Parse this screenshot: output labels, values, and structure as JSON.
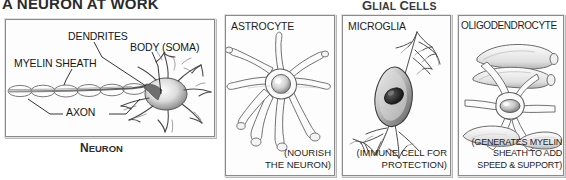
{
  "headings": {
    "neuron_title": "A NEURON AT WORK",
    "glial_title_first": "G",
    "glial_title_first_rest": "LIAL ",
    "glial_title_second": "C",
    "glial_title_second_rest": "ELLS"
  },
  "neuron_panel": {
    "caption_first": "N",
    "caption_rest": "EURON",
    "callouts": {
      "dendrites": "DENDRITES",
      "body": "BODY (SOMA)",
      "myelin_sheath": "MYELIN SHEATH",
      "axon": "AXON"
    }
  },
  "glial_panels": [
    {
      "key": "astrocyte",
      "label": "ASTROCYTE",
      "caption_lines": [
        "(NOURISH",
        "THE NEURON)"
      ]
    },
    {
      "key": "microglia",
      "label": "MICROGLIA",
      "caption_lines": [
        "(IMMUNE CELL FOR",
        "PROTECTION)"
      ]
    },
    {
      "key": "oligodendrocyte",
      "label": "OLIGODENDROCYTE",
      "caption_lines": [
        "(GENERATES MYELIN",
        "SHEATH TO ADD",
        "SPEED & SUPPORT)"
      ]
    }
  ],
  "colors": {
    "background": "#ffffff",
    "ink": "#1a1a1a",
    "frame": "#8a8a8a",
    "pencil": "#6e6e6e",
    "shade": "#b5b5b5"
  }
}
